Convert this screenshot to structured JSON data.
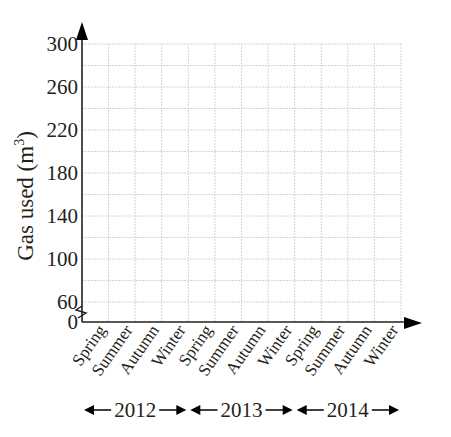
{
  "chart_data": {
    "type": "line",
    "title": "",
    "xlabel": "",
    "ylabel": "Gas used (m",
    "ylabel_superscript": "3",
    "ylabel_suffix": ")",
    "categories": [
      "Spring",
      "Summer",
      "Autumn",
      "Winter",
      "Spring",
      "Summer",
      "Autumn",
      "Winter",
      "Spring",
      "Summer",
      "Autumn",
      "Winter"
    ],
    "year_groups": [
      {
        "label": "2012",
        "start": 0,
        "end": 3
      },
      {
        "label": "2013",
        "start": 4,
        "end": 7
      },
      {
        "label": "2014",
        "start": 8,
        "end": 11
      }
    ],
    "series": [],
    "y_ticks": [
      "0",
      "60",
      "100",
      "140",
      "180",
      "220",
      "260",
      "300"
    ],
    "ylim": [
      60,
      300
    ],
    "y_grid_step": 20,
    "axis_break": true,
    "grid": true,
    "legend": "none"
  }
}
